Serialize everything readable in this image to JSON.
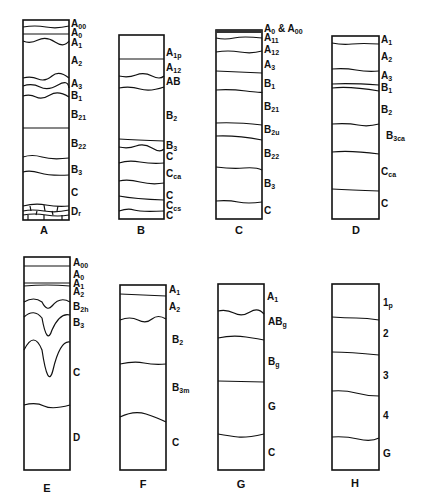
{
  "figure": {
    "profiles": [
      {
        "id": "A",
        "caption": "A",
        "horizons": [
          {
            "main": "A",
            "sub": "00"
          },
          {
            "main": "A",
            "sub": "0"
          },
          {
            "main": "A",
            "sub": "1"
          },
          {
            "main": "A",
            "sub": "2"
          },
          {
            "main": "A",
            "sub": "3"
          },
          {
            "main": "B",
            "sub": "1"
          },
          {
            "main": "B",
            "sub": "21"
          },
          {
            "main": "B",
            "sub": "22"
          },
          {
            "main": "B",
            "sub": "3"
          },
          {
            "main": "C",
            "sub": ""
          },
          {
            "main": "D",
            "sub": "r"
          }
        ]
      },
      {
        "id": "B",
        "caption": "B",
        "horizons": [
          {
            "main": "A",
            "sub": "1p"
          },
          {
            "main": "A",
            "sub": "12"
          },
          {
            "main": "AB",
            "sub": ""
          },
          {
            "main": "B",
            "sub": "2"
          },
          {
            "main": "B",
            "sub": "3"
          },
          {
            "main": "C",
            "sub": ""
          },
          {
            "main": "C",
            "sub": "ca"
          },
          {
            "main": "C",
            "sub": ""
          },
          {
            "main": "C",
            "sub": "cs"
          },
          {
            "main": "C",
            "sub": ""
          }
        ]
      },
      {
        "id": "C",
        "caption": "C",
        "horizons": [
          {
            "main": "A",
            "sub": "0",
            "suffix": " & A",
            "suffix_sub": "00"
          },
          {
            "main": "A",
            "sub": "11"
          },
          {
            "main": "A",
            "sub": "12"
          },
          {
            "main": "A",
            "sub": "3"
          },
          {
            "main": "B",
            "sub": "1"
          },
          {
            "main": "B",
            "sub": "21"
          },
          {
            "main": "B",
            "sub": "2u"
          },
          {
            "main": "B",
            "sub": "22"
          },
          {
            "main": "B",
            "sub": "3"
          },
          {
            "main": "C",
            "sub": ""
          }
        ]
      },
      {
        "id": "D",
        "caption": "D",
        "horizons": [
          {
            "main": "A",
            "sub": "1"
          },
          {
            "main": "A",
            "sub": "2"
          },
          {
            "main": "A",
            "sub": "3"
          },
          {
            "main": "B",
            "sub": "1"
          },
          {
            "main": "B",
            "sub": "2"
          },
          {
            "main": "B",
            "sub": "3ca"
          },
          {
            "main": "C",
            "sub": "ca"
          },
          {
            "main": "C",
            "sub": ""
          }
        ]
      },
      {
        "id": "E",
        "caption": "E",
        "horizons": [
          {
            "main": "A",
            "sub": "00"
          },
          {
            "main": "A",
            "sub": "0"
          },
          {
            "main": "A",
            "sub": "1"
          },
          {
            "main": "A",
            "sub": "2"
          },
          {
            "main": "B",
            "sub": "2h"
          },
          {
            "main": "B",
            "sub": "3"
          },
          {
            "main": "C",
            "sub": ""
          },
          {
            "main": "D",
            "sub": ""
          }
        ]
      },
      {
        "id": "F",
        "caption": "F",
        "horizons": [
          {
            "main": "A",
            "sub": "1"
          },
          {
            "main": "A",
            "sub": "2"
          },
          {
            "main": "B",
            "sub": "2"
          },
          {
            "main": "B",
            "sub": "3m"
          },
          {
            "main": "C",
            "sub": ""
          }
        ]
      },
      {
        "id": "G",
        "caption": "G",
        "horizons": [
          {
            "main": "A",
            "sub": "1"
          },
          {
            "main": "AB",
            "sub": "g"
          },
          {
            "main": "B",
            "sub": "g"
          },
          {
            "main": "G",
            "sub": ""
          },
          {
            "main": "C",
            "sub": ""
          }
        ]
      },
      {
        "id": "H",
        "caption": "H",
        "horizons": [
          {
            "main": "1",
            "sub": "p"
          },
          {
            "main": "2",
            "sub": ""
          },
          {
            "main": "3",
            "sub": ""
          },
          {
            "main": "4",
            "sub": ""
          },
          {
            "main": "G",
            "sub": ""
          }
        ]
      }
    ]
  }
}
